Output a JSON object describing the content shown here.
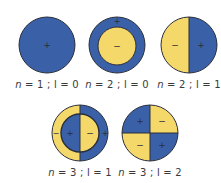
{
  "colors": {
    "blue": "#3a61a8",
    "yellow": "#f4d86a",
    "outline": "#2a2e3a",
    "sign": "#2a2e3a"
  },
  "orbitals": [
    {
      "id": "n1l0",
      "label": {
        "n": "n",
        "rest": " = 1 ; l = 0"
      },
      "signs": [
        "+"
      ]
    },
    {
      "id": "n2l0",
      "label": {
        "n": "n",
        "rest": " = 2 ; l = 0"
      },
      "signs": [
        "+",
        "−"
      ]
    },
    {
      "id": "n2l1",
      "label": {
        "n": "n",
        "rest": " = 2 ; l = 1"
      },
      "signs": [
        "−",
        "+"
      ]
    },
    {
      "id": "n3l1",
      "label": {
        "n": "n",
        "rest": " = 3 ; l = 1"
      },
      "signs": [
        "−",
        "+",
        "−",
        "+"
      ]
    },
    {
      "id": "n3l2",
      "label": {
        "n": "n",
        "rest": " = 3 ; l = 2"
      },
      "signs": [
        "+",
        "−",
        "−",
        "+"
      ]
    }
  ]
}
